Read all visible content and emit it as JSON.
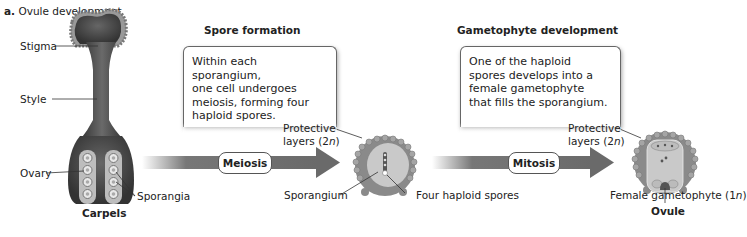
{
  "title": {
    "letter": "a.",
    "text": "Ovule development"
  },
  "stages": {
    "carpels": {
      "caption": "Carpels",
      "labels": {
        "stigma": "Stigma",
        "style": "Style",
        "ovary": "Ovary",
        "sporangia": "Sporangia"
      }
    },
    "spore_formation": {
      "heading": "Spore formation",
      "description": "Within each sporangium, one cell undergoes meiosis, forming four haploid spores.",
      "description_lines": [
        "Within each sporangium,",
        "one cell undergoes",
        "meiosis, forming four",
        "haploid spores."
      ],
      "process": "Meiosis",
      "labels": {
        "protective_line1": "Protective",
        "protective_line2_pre": "layers (2",
        "protective_n": "n",
        "protective_line2_post": ")",
        "sporangium": "Sporangium",
        "spores": "Four haploid spores"
      }
    },
    "gametophyte_development": {
      "heading": "Gametophyte development",
      "description": "One of the haploid spores develops into a female gametophyte that fills the sporangium.",
      "description_lines": [
        "One of the haploid",
        "spores develops into a",
        "female gametophyte",
        "that fills the sporangium."
      ],
      "process": "Mitosis",
      "caption": "Ovule",
      "labels": {
        "protective_line1": "Protective",
        "protective_line2_pre": "layers (2",
        "protective_n": "n",
        "protective_line2_post": ")",
        "gametophyte_pre": "Female gametophyte (1",
        "gametophyte_n": "n",
        "gametophyte_post": ")"
      }
    }
  },
  "colors": {
    "tissue_dark": "#4a4a4a",
    "tissue_mid": "#8a8a8a",
    "tissue_light": "#cfcfcf",
    "arrow": "#6e6e6e"
  }
}
